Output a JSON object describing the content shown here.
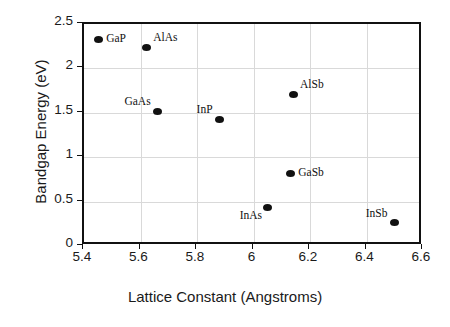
{
  "chart_data": {
    "type": "scatter",
    "title": "",
    "xlabel": "Lattice Constant (Angstroms)",
    "ylabel": "Bandgap Energy (eV)",
    "xlim": [
      5.4,
      6.6
    ],
    "ylim": [
      0,
      2.5
    ],
    "grid": true,
    "legend": "none",
    "xticks": [
      "5.4",
      "5.6",
      "5.8",
      "6",
      "6.2",
      "6.4",
      "6.6"
    ],
    "xtick_values": [
      5.4,
      5.6,
      5.8,
      6.0,
      6.2,
      6.4,
      6.6
    ],
    "yticks": [
      "0",
      "0.5",
      "1",
      "1.5",
      "2",
      "2.5"
    ],
    "ytick_values": [
      0,
      0.5,
      1.0,
      1.5,
      2.0,
      2.5
    ],
    "marker_color": "#111111",
    "grid_color": "#d9d9d9",
    "axis_color": "#111111",
    "points": [
      {
        "label": "GaP",
        "x": 5.45,
        "y": 2.33,
        "label_pos": "right"
      },
      {
        "label": "AlAs",
        "x": 5.62,
        "y": 2.24,
        "label_pos": "upper-right"
      },
      {
        "label": "GaAs",
        "x": 5.66,
        "y": 1.52,
        "label_pos": "upper-left"
      },
      {
        "label": "InP",
        "x": 5.88,
        "y": 1.43,
        "label_pos": "upper-left"
      },
      {
        "label": "AlSb",
        "x": 6.14,
        "y": 1.71,
        "label_pos": "upper-right"
      },
      {
        "label": "GaSb",
        "x": 6.13,
        "y": 0.82,
        "label_pos": "right"
      },
      {
        "label": "InAs",
        "x": 6.05,
        "y": 0.43,
        "label_pos": "lower-left"
      },
      {
        "label": "InSb",
        "x": 6.5,
        "y": 0.26,
        "label_pos": "upper-left"
      }
    ]
  }
}
